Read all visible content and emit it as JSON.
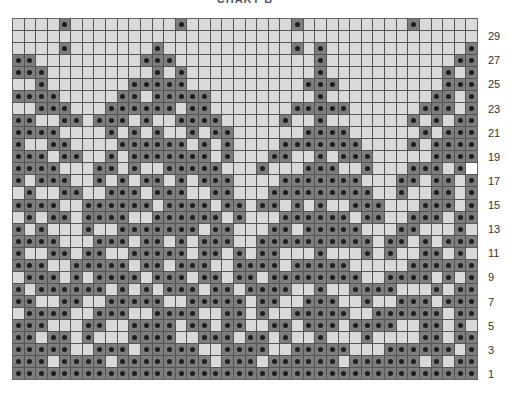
{
  "chart": {
    "title": "CHART B",
    "columns": 40,
    "rows": 30,
    "row_labels": [
      "1",
      "3",
      "5",
      "7",
      "9",
      "11",
      "13",
      "15",
      "17",
      "19",
      "21",
      "23",
      "25",
      "27",
      "29"
    ],
    "colors": {
      "light": "#d9d9d9",
      "dark": "#7d7d7d",
      "dot": "#1e1e1e",
      "highlight": "#ffffff",
      "gridline": "#555555"
    },
    "legend_note": "Dark cell with dot = contrast color stitch; light cell = main color",
    "highlight_cells": [
      {
        "row": 18,
        "col": 39
      }
    ],
    "dark_cells_by_row": {
      "30": [
        4,
        14,
        24,
        34
      ],
      "29": [],
      "28": [
        4,
        12,
        24,
        26,
        39
      ],
      "27": [
        0,
        1,
        11,
        12,
        13,
        26,
        38,
        39
      ],
      "26": [
        0,
        1,
        2,
        12,
        14,
        26,
        37,
        39
      ],
      "25": [
        2,
        10,
        11,
        12,
        13,
        14,
        25,
        26,
        27,
        37,
        38,
        39
      ],
      "24": [
        0,
        1,
        2,
        3,
        9,
        10,
        12,
        13,
        14,
        15,
        16,
        26,
        36,
        37,
        39
      ],
      "23": [
        2,
        3,
        4,
        8,
        9,
        10,
        11,
        12,
        13,
        15,
        16,
        24,
        25,
        26,
        27,
        28,
        35,
        36,
        37,
        39
      ],
      "22": [
        0,
        1,
        4,
        5,
        7,
        8,
        9,
        11,
        14,
        15,
        16,
        17,
        23,
        26,
        34,
        36,
        38,
        39
      ],
      "21": [
        0,
        1,
        2,
        3,
        8,
        10,
        12,
        15,
        17,
        18,
        25,
        26,
        27,
        28,
        35,
        37,
        38,
        39
      ],
      "20": [
        0,
        3,
        4,
        9,
        10,
        11,
        12,
        13,
        14,
        16,
        18,
        23,
        24,
        25,
        26,
        27,
        28,
        29,
        34,
        36,
        37,
        38,
        39
      ],
      "19": [
        0,
        1,
        2,
        4,
        5,
        8,
        10,
        11,
        12,
        13,
        14,
        15,
        16,
        18,
        22,
        23,
        26,
        28,
        29,
        30,
        36,
        37,
        38,
        39
      ],
      "18": [
        0,
        1,
        2,
        3,
        7,
        8,
        10,
        13,
        14,
        15,
        16,
        17,
        21,
        25,
        26,
        27,
        30,
        34,
        35,
        36,
        38
      ],
      "17": [
        0,
        2,
        3,
        4,
        7,
        9,
        11,
        12,
        14,
        16,
        17,
        18,
        23,
        24,
        25,
        26,
        27,
        28,
        29,
        33,
        34,
        36,
        37,
        39
      ],
      "16": [
        1,
        4,
        5,
        8,
        9,
        10,
        12,
        13,
        14,
        17,
        18,
        22,
        23,
        24,
        25,
        26,
        27,
        28,
        29,
        30,
        33,
        36,
        37,
        39
      ],
      "15": [
        0,
        1,
        2,
        3,
        6,
        7,
        8,
        9,
        10,
        11,
        13,
        14,
        15,
        16,
        18,
        19,
        21,
        22,
        24,
        26,
        29,
        30,
        31,
        35,
        36,
        37,
        39
      ],
      "14": [
        1,
        3,
        4,
        6,
        7,
        8,
        9,
        12,
        13,
        14,
        15,
        16,
        17,
        19,
        23,
        24,
        25,
        26,
        27,
        28,
        30,
        31,
        34,
        35,
        36,
        38,
        39
      ],
      "13": [
        0,
        2,
        6,
        9,
        10,
        11,
        12,
        13,
        14,
        15,
        17,
        18,
        22,
        23,
        25,
        26,
        27,
        28,
        29,
        33,
        34,
        38
      ],
      "12": [
        0,
        1,
        2,
        3,
        7,
        8,
        9,
        11,
        12,
        14,
        16,
        17,
        18,
        21,
        22,
        23,
        24,
        25,
        26,
        27,
        28,
        29,
        30,
        32,
        33,
        35,
        37,
        38,
        39
      ],
      "11": [
        0,
        3,
        4,
        6,
        7,
        10,
        11,
        12,
        13,
        14,
        16,
        17,
        19,
        21,
        22,
        26,
        30,
        32,
        35,
        36,
        38
      ],
      "10": [
        0,
        1,
        2,
        5,
        6,
        7,
        8,
        9,
        11,
        12,
        14,
        15,
        16,
        19,
        20,
        21,
        22,
        24,
        25,
        26,
        27,
        28,
        34,
        35,
        36,
        37,
        38,
        39
      ],
      "9": [
        1,
        2,
        3,
        5,
        7,
        8,
        9,
        10,
        12,
        13,
        14,
        16,
        17,
        19,
        20,
        22,
        23,
        24,
        25,
        26,
        27,
        28,
        29,
        32,
        33,
        34,
        35,
        37,
        39
      ],
      "8": [
        0,
        2,
        3,
        4,
        5,
        6,
        7,
        9,
        11,
        13,
        14,
        15,
        17,
        18,
        20,
        21,
        22,
        23,
        26,
        29,
        30,
        31,
        32,
        36,
        38,
        39
      ],
      "7": [
        0,
        1,
        4,
        5,
        8,
        9,
        10,
        11,
        12,
        15,
        16,
        17,
        18,
        19,
        21,
        22,
        25,
        26,
        27,
        30,
        33,
        34,
        35,
        37,
        38,
        39
      ],
      "6": [
        1,
        2,
        3,
        4,
        7,
        8,
        9,
        12,
        13,
        14,
        15,
        18,
        19,
        21,
        24,
        25,
        26,
        27,
        28,
        31,
        32,
        33,
        34,
        35,
        36,
        38,
        39
      ],
      "5": [
        0,
        1,
        2,
        6,
        7,
        10,
        11,
        12,
        13,
        15,
        16,
        18,
        19,
        22,
        23,
        25,
        26,
        27,
        29,
        30,
        31,
        32,
        35,
        36,
        38
      ],
      "4": [
        0,
        1,
        3,
        4,
        6,
        10,
        11,
        12,
        13,
        16,
        17,
        18,
        20,
        21,
        23,
        26,
        30,
        35,
        36,
        38,
        39
      ],
      "3": [
        0,
        1,
        2,
        3,
        4,
        7,
        8,
        9,
        11,
        12,
        13,
        14,
        15,
        18,
        19,
        20,
        21,
        24,
        25,
        26,
        27,
        28,
        32,
        33,
        34,
        35,
        36,
        37,
        39
      ],
      "2": [
        0,
        1,
        2,
        4,
        5,
        6,
        7,
        9,
        10,
        11,
        12,
        13,
        14,
        15,
        16,
        18,
        19,
        20,
        22,
        23,
        24,
        25,
        26,
        27,
        29,
        30,
        31,
        32,
        33,
        34,
        36,
        38,
        39
      ],
      "1": [
        0,
        1,
        2,
        3,
        4,
        5,
        6,
        7,
        8,
        9,
        10,
        11,
        12,
        13,
        14,
        15,
        16,
        17,
        18,
        19,
        20,
        21,
        22,
        23,
        24,
        25,
        26,
        27,
        28,
        29,
        30,
        31,
        32,
        33,
        34,
        35,
        36,
        37,
        38,
        39
      ]
    }
  }
}
